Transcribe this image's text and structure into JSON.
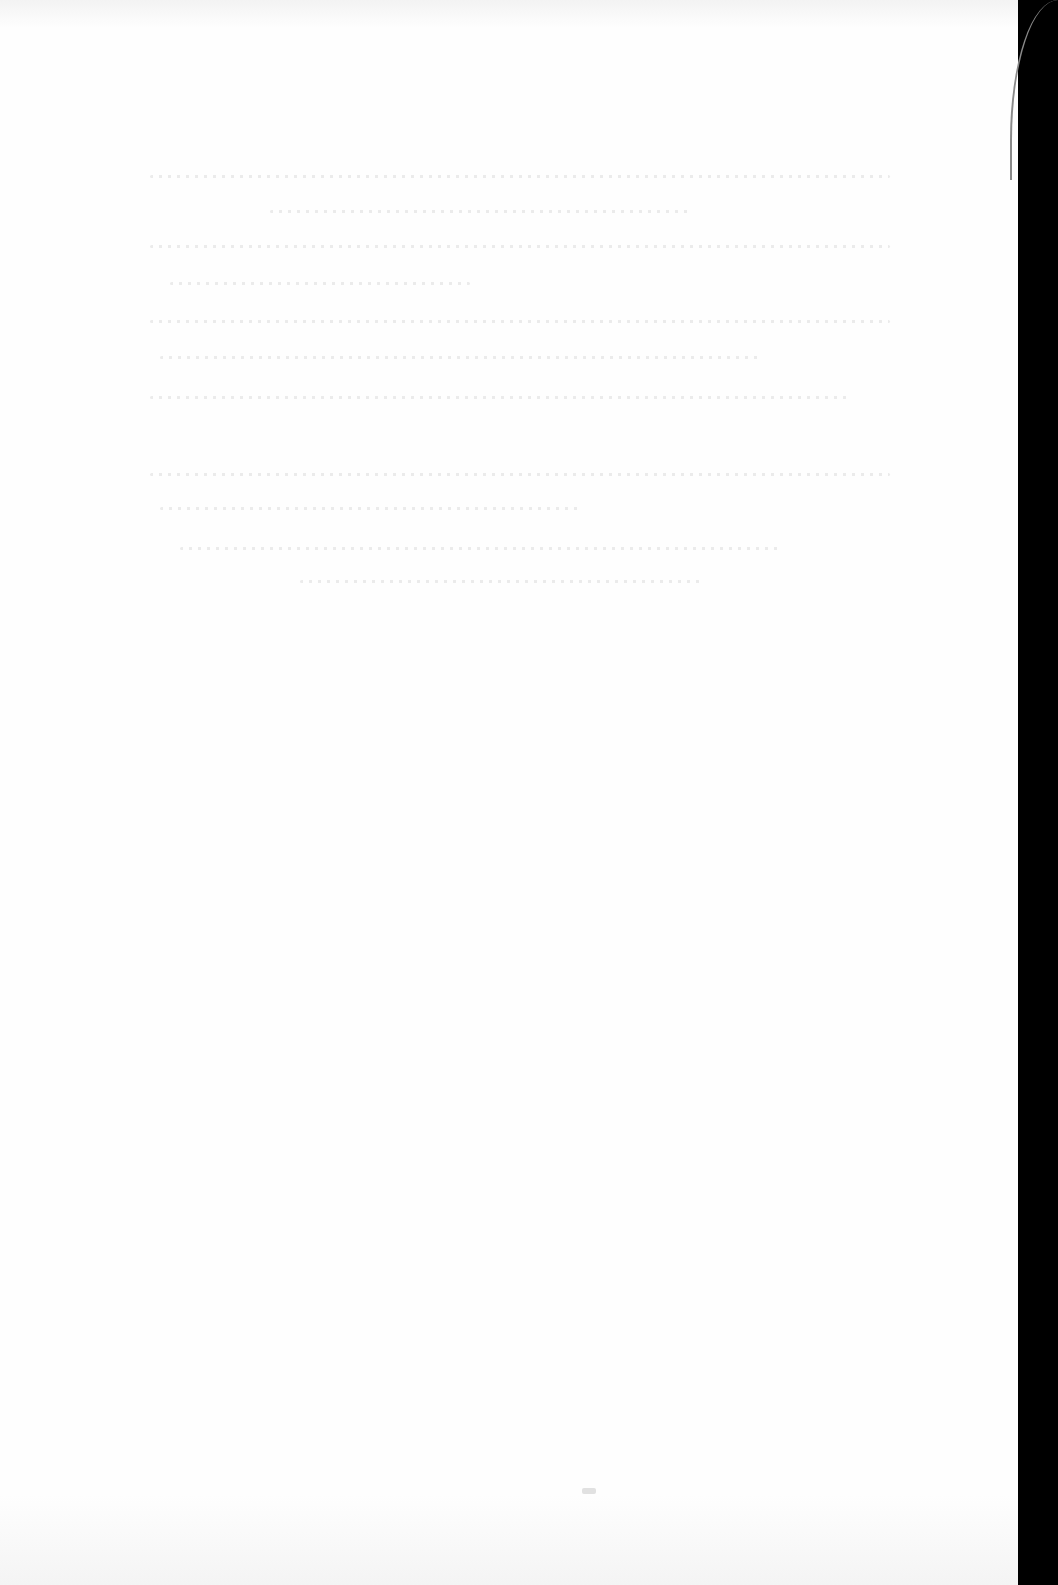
{
  "document": {
    "type": "scanned-page",
    "content_state": "blank-with-bleed-through",
    "legible_text": ""
  },
  "colors": {
    "page_background": "#fefefe",
    "scan_border": "#000000",
    "bleed_through": "#c8c8c8"
  },
  "bleed_lines": [
    {
      "top": 175,
      "left": 150,
      "width": 740
    },
    {
      "top": 210,
      "left": 270,
      "width": 420
    },
    {
      "top": 245,
      "left": 150,
      "width": 740
    },
    {
      "top": 282,
      "left": 170,
      "width": 300
    },
    {
      "top": 320,
      "left": 150,
      "width": 740
    },
    {
      "top": 356,
      "left": 160,
      "width": 600
    },
    {
      "top": 396,
      "left": 150,
      "width": 700
    },
    {
      "top": 473,
      "left": 150,
      "width": 740
    },
    {
      "top": 507,
      "left": 160,
      "width": 420
    },
    {
      "top": 547,
      "left": 180,
      "width": 600
    },
    {
      "top": 580,
      "left": 300,
      "width": 400
    }
  ]
}
